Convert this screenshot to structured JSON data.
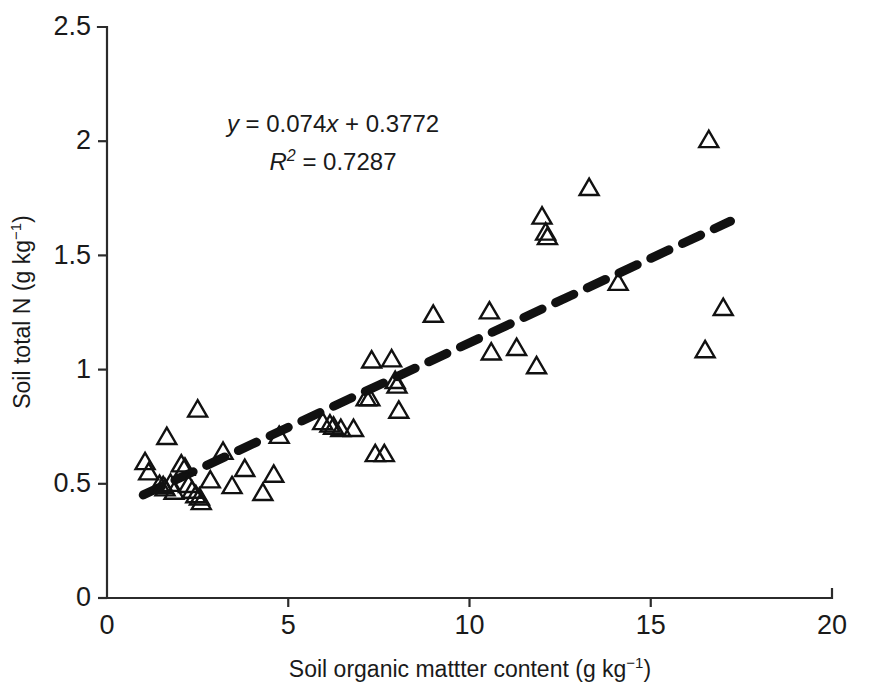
{
  "figure": {
    "background_color": "#ffffff",
    "foreground_color": "#1a1a1a",
    "marker_color": "#111111",
    "trendline_color": "#111111"
  },
  "annotations": {
    "equation_y": "y",
    "equation_rest": " = 0.074x + 0.3772",
    "equation_full": "y = 0.074x + 0.3772",
    "r2_symbol": "R",
    "r2_exponent": "2",
    "r2_rest": " = 0.7287",
    "r2_full": "R2 = 0.7287"
  },
  "axes": {
    "x": {
      "label_main": "Soil organic mattter content (g kg",
      "label_exponent": "−1",
      "label_tail": ")",
      "label_full": "Soil organic mattter content (g kg−1)",
      "ticks": [
        0,
        5,
        10,
        15,
        20
      ],
      "tick_labels": [
        "0",
        "5",
        "10",
        "15",
        "20"
      ],
      "min": 0,
      "max": 20
    },
    "y": {
      "label_main": "Soil total N (g kg",
      "label_exponent": "−1",
      "label_tail": ")",
      "label_full": "Soil total N (g kg−1)",
      "ticks": [
        0,
        0.5,
        1,
        1.5,
        2,
        2.5
      ],
      "tick_labels": [
        "0",
        "0.5",
        "1",
        "1.5",
        "2",
        "2.5"
      ],
      "min": 0,
      "max": 2.5
    }
  },
  "chart_data": {
    "type": "scatter",
    "title": "",
    "xlabel": "Soil organic mattter content (g kg-1)",
    "ylabel": "Soil total N (g kg-1)",
    "xlim": [
      0,
      20
    ],
    "ylim": [
      0,
      2.5
    ],
    "grid": false,
    "legend": false,
    "marker": "open-triangle-up",
    "series": [
      {
        "name": "Soil samples",
        "points": [
          [
            1.05,
            0.6
          ],
          [
            1.15,
            0.555
          ],
          [
            1.45,
            0.5
          ],
          [
            1.55,
            0.495
          ],
          [
            1.6,
            0.485
          ],
          [
            1.65,
            0.71
          ],
          [
            1.75,
            0.505
          ],
          [
            1.85,
            0.47
          ],
          [
            2.05,
            0.59
          ],
          [
            2.15,
            0.575
          ],
          [
            2.25,
            0.5
          ],
          [
            2.35,
            0.475
          ],
          [
            2.45,
            0.455
          ],
          [
            2.5,
            0.83
          ],
          [
            2.55,
            0.445
          ],
          [
            2.6,
            0.425
          ],
          [
            2.85,
            0.52
          ],
          [
            3.2,
            0.645
          ],
          [
            3.45,
            0.495
          ],
          [
            3.8,
            0.57
          ],
          [
            4.3,
            0.465
          ],
          [
            4.6,
            0.545
          ],
          [
            4.75,
            0.715
          ],
          [
            5.95,
            0.775
          ],
          [
            6.15,
            0.765
          ],
          [
            6.25,
            0.755
          ],
          [
            6.45,
            0.745
          ],
          [
            6.8,
            0.745
          ],
          [
            7.15,
            0.88
          ],
          [
            7.25,
            0.88
          ],
          [
            7.3,
            1.045
          ],
          [
            7.4,
            0.635
          ],
          [
            7.65,
            0.635
          ],
          [
            7.85,
            1.05
          ],
          [
            7.95,
            0.955
          ],
          [
            8.0,
            0.935
          ],
          [
            8.05,
            0.825
          ],
          [
            9.0,
            1.245
          ],
          [
            10.55,
            1.26
          ],
          [
            10.6,
            1.08
          ],
          [
            11.3,
            1.1
          ],
          [
            11.85,
            1.02
          ],
          [
            12.0,
            1.675
          ],
          [
            12.1,
            1.605
          ],
          [
            12.15,
            1.585
          ],
          [
            13.3,
            1.8
          ],
          [
            14.1,
            1.385
          ],
          [
            16.5,
            1.09
          ],
          [
            16.6,
            2.01
          ],
          [
            17.0,
            1.275
          ]
        ]
      }
    ],
    "trendline": {
      "type": "linear",
      "style": "dashed",
      "slope": 0.074,
      "intercept": 0.3772,
      "x_start": 1.0,
      "x_end": 17.2,
      "equation_label": "y = 0.074x + 0.3772",
      "r_squared": 0.7287,
      "r_squared_label": "R2 = 0.7287"
    }
  },
  "geometry": {
    "plot_left": 107,
    "plot_right": 832,
    "plot_top": 27,
    "plot_bottom": 598,
    "marker_size": 19
  }
}
